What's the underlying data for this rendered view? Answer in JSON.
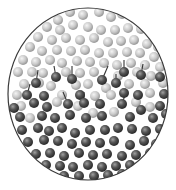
{
  "diagram": {
    "type": "particle-phase-diagram",
    "boundary": {
      "cx": 88,
      "cy": 94,
      "rx": 80,
      "ry": 86,
      "stroke": "#3a3a3a"
    },
    "colors": {
      "light_particle": "#c4c4c4",
      "light_particle_highlight": "#f2f2f2",
      "dark_particle": "#4a4a4a",
      "dark_particle_highlight": "#9a9a9a",
      "trail": "#333333"
    },
    "particle_radius": 5,
    "light_particles": [
      [
        70,
        12
      ],
      [
        83,
        15
      ],
      [
        99,
        12
      ],
      [
        111,
        17
      ],
      [
        122,
        14
      ],
      [
        135,
        19
      ],
      [
        58,
        20
      ],
      [
        47,
        27
      ],
      [
        60,
        30
      ],
      [
        73,
        25
      ],
      [
        88,
        27
      ],
      [
        101,
        30
      ],
      [
        115,
        30
      ],
      [
        128,
        28
      ],
      [
        141,
        29
      ],
      [
        152,
        34
      ],
      [
        38,
        37
      ],
      [
        52,
        40
      ],
      [
        66,
        38
      ],
      [
        80,
        40
      ],
      [
        94,
        38
      ],
      [
        108,
        42
      ],
      [
        121,
        41
      ],
      [
        134,
        40
      ],
      [
        147,
        44
      ],
      [
        158,
        47
      ],
      [
        30,
        47
      ],
      [
        42,
        51
      ],
      [
        57,
        50
      ],
      [
        71,
        51
      ],
      [
        85,
        50
      ],
      [
        99,
        53
      ],
      [
        113,
        53
      ],
      [
        127,
        52
      ],
      [
        140,
        53
      ],
      [
        154,
        57
      ],
      [
        23,
        60
      ],
      [
        36,
        62
      ],
      [
        50,
        60
      ],
      [
        62,
        63
      ],
      [
        77,
        61
      ],
      [
        90,
        62
      ],
      [
        104,
        63
      ],
      [
        117,
        65
      ],
      [
        131,
        63
      ],
      [
        145,
        65
      ],
      [
        160,
        67
      ],
      [
        18,
        72
      ],
      [
        32,
        72
      ],
      [
        43,
        73
      ],
      [
        66,
        72
      ],
      [
        80,
        73
      ],
      [
        94,
        72
      ],
      [
        118,
        76
      ],
      [
        137,
        72
      ],
      [
        151,
        76
      ],
      [
        24,
        84
      ],
      [
        39,
        83
      ],
      [
        51,
        86
      ],
      [
        76,
        85
      ],
      [
        88,
        84
      ],
      [
        106,
        88
      ],
      [
        129,
        84
      ],
      [
        145,
        84
      ],
      [
        163,
        83
      ],
      [
        17,
        95
      ],
      [
        62,
        95
      ],
      [
        95,
        96
      ],
      [
        111,
        95
      ],
      [
        150,
        93
      ],
      [
        21,
        106
      ],
      [
        57,
        102
      ],
      [
        136,
        102
      ],
      [
        114,
        112
      ],
      [
        93,
        113
      ],
      [
        150,
        107
      ],
      [
        30,
        118
      ],
      [
        78,
        106
      ]
    ],
    "dark_particles": [
      [
        36,
        83
      ],
      [
        56,
        77
      ],
      [
        72,
        79
      ],
      [
        102,
        80
      ],
      [
        124,
        72
      ],
      [
        141,
        75
      ],
      [
        160,
        77
      ],
      [
        27,
        95
      ],
      [
        44,
        96
      ],
      [
        80,
        95
      ],
      [
        124,
        93
      ],
      [
        138,
        95
      ],
      [
        164,
        94
      ],
      [
        116,
        83
      ],
      [
        14,
        108
      ],
      [
        34,
        103
      ],
      [
        47,
        107
      ],
      [
        68,
        104
      ],
      [
        84,
        103
      ],
      [
        100,
        104
      ],
      [
        122,
        104
      ],
      [
        141,
        110
      ],
      [
        160,
        106
      ],
      [
        20,
        117
      ],
      [
        42,
        116
      ],
      [
        55,
        118
      ],
      [
        70,
        115
      ],
      [
        86,
        118
      ],
      [
        102,
        116
      ],
      [
        130,
        117
      ],
      [
        153,
        118
      ],
      [
        166,
        114
      ],
      [
        22,
        130
      ],
      [
        38,
        128
      ],
      [
        49,
        131
      ],
      [
        62,
        128
      ],
      [
        75,
        133
      ],
      [
        90,
        130
      ],
      [
        105,
        130
      ],
      [
        118,
        128
      ],
      [
        132,
        129
      ],
      [
        146,
        131
      ],
      [
        160,
        129
      ],
      [
        28,
        142
      ],
      [
        44,
        140
      ],
      [
        58,
        141
      ],
      [
        72,
        144
      ],
      [
        86,
        142
      ],
      [
        100,
        143
      ],
      [
        114,
        141
      ],
      [
        130,
        145
      ],
      [
        144,
        141
      ],
      [
        156,
        144
      ],
      [
        36,
        154
      ],
      [
        50,
        153
      ],
      [
        64,
        156
      ],
      [
        79,
        153
      ],
      [
        93,
        155
      ],
      [
        107,
        154
      ],
      [
        122,
        156
      ],
      [
        136,
        155
      ],
      [
        150,
        153
      ],
      [
        46,
        165
      ],
      [
        60,
        166
      ],
      [
        73,
        167
      ],
      [
        88,
        165
      ],
      [
        102,
        167
      ],
      [
        116,
        166
      ],
      [
        130,
        165
      ],
      [
        142,
        164
      ],
      [
        64,
        176
      ],
      [
        79,
        176
      ],
      [
        94,
        176
      ],
      [
        108,
        175
      ],
      [
        122,
        174
      ]
    ],
    "trails": [
      [
        36,
        83,
        38,
        70
      ],
      [
        56,
        77,
        54,
        66
      ],
      [
        72,
        79,
        72,
        66
      ],
      [
        102,
        80,
        108,
        66
      ],
      [
        124,
        72,
        124,
        60
      ],
      [
        116,
        83,
        116,
        74
      ],
      [
        141,
        75,
        143,
        64
      ],
      [
        84,
        103,
        84,
        92
      ],
      [
        68,
        104,
        63,
        92
      ],
      [
        122,
        104,
        126,
        92
      ],
      [
        27,
        95,
        30,
        84
      ]
    ]
  }
}
